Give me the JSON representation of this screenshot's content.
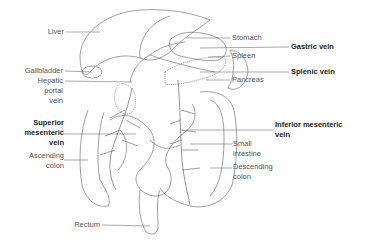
{
  "diagram": {
    "labels": {
      "liver": "Liver",
      "gallbladder": "Gallbladder",
      "hepatic_portal_vein_1": "Hepatic",
      "hepatic_portal_vein_2": "portal",
      "hepatic_portal_vein_3": "vein",
      "superior_mesenteric_1": "Superior",
      "superior_mesenteric_2": "mesenteric",
      "superior_mesenteric_3": "vein",
      "ascending_colon_1": "Ascending",
      "ascending_colon_2": "colon",
      "rectum": "Rectum",
      "stomach": "Stomach",
      "gastric_vein": "Gastric vein",
      "spleen": "Spleen",
      "splenic_vein": "Splenic vein",
      "pancreas": "Pancreas",
      "inferior_mesenteric_1": "Inferior mesenteric",
      "inferior_mesenteric_2": "vein",
      "small_intestine_1": "Small",
      "small_intestine_2": "intestine",
      "descending_colon_1": "Descending",
      "descending_colon_2": "colon"
    },
    "bold_labels": [
      "Gastric vein",
      "Splenic vein",
      "Superior mesenteric vein",
      "Inferior mesenteric vein"
    ],
    "colors": {
      "line": "#555555",
      "label": "#555555",
      "bold_label": "#222222",
      "background": "#ffffff"
    }
  }
}
